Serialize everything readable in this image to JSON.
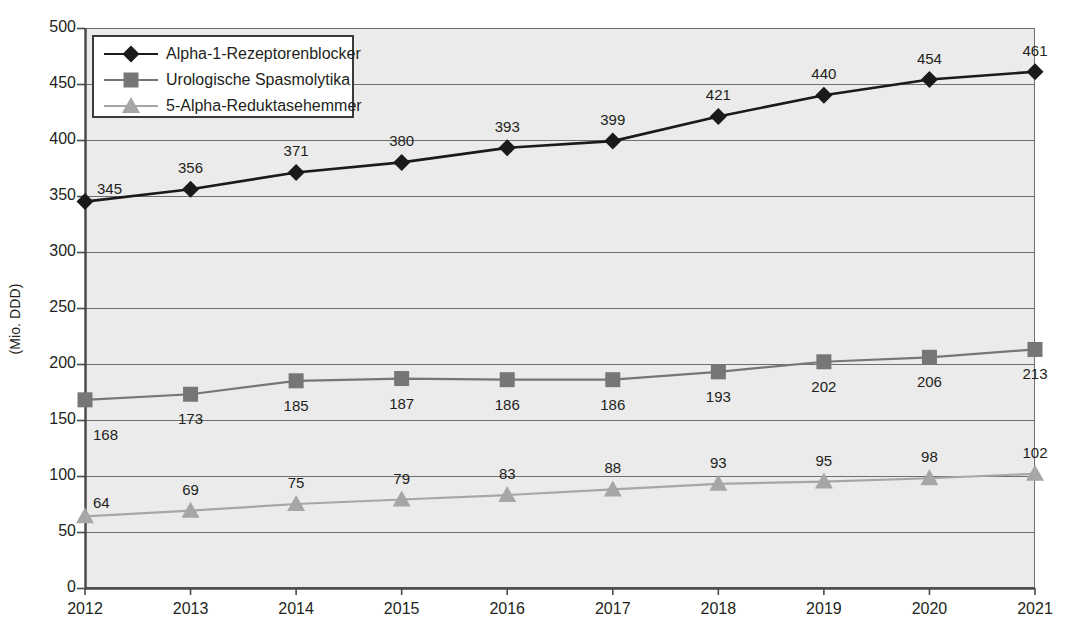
{
  "chart_data": {
    "type": "line",
    "title": "",
    "xlabel": "",
    "ylabel": "(Mio. DDD)",
    "categories": [
      "2012",
      "2013",
      "2014",
      "2015",
      "2016",
      "2017",
      "2018",
      "2019",
      "2020",
      "2021"
    ],
    "ylim": [
      0,
      500
    ],
    "yticks": [
      0,
      50,
      100,
      150,
      200,
      250,
      300,
      350,
      400,
      450,
      500
    ],
    "ytick_labels": [
      "0",
      "50",
      "100",
      "150",
      "200",
      "250",
      "300",
      "350",
      "400",
      "450",
      "500"
    ],
    "grid": true,
    "grid_axis": "y",
    "legend_position": "top-left",
    "series": [
      {
        "name": "Alpha-1-Rezeptorenblocker",
        "marker": "diamond",
        "color": "#1a1a1a",
        "values": [
          345,
          356,
          371,
          380,
          393,
          399,
          421,
          440,
          454,
          461
        ],
        "labels": [
          "345",
          "356",
          "371",
          "380",
          "393",
          "399",
          "421",
          "440",
          "454",
          "461"
        ]
      },
      {
        "name": "Urologische Spasmolytika",
        "marker": "square",
        "color": "#767676",
        "values": [
          168,
          173,
          185,
          187,
          186,
          186,
          193,
          202,
          206,
          213
        ],
        "labels": [
          "168",
          "173",
          "185",
          "187",
          "186",
          "186",
          "193",
          "202",
          "206",
          "213"
        ]
      },
      {
        "name": "5-Alpha-Reduktasehemmer",
        "marker": "triangle",
        "color": "#a6a6a6",
        "values": [
          64,
          69,
          75,
          79,
          83,
          88,
          93,
          95,
          98,
          102
        ],
        "labels": [
          "64",
          "69",
          "75",
          "79",
          "83",
          "88",
          "93",
          "95",
          "98",
          "102"
        ]
      }
    ]
  },
  "legend": {
    "items": [
      {
        "label": "Alpha-1-Rezeptorenblocker",
        "icon": "diamond-marker-icon"
      },
      {
        "label": "Urologische Spasmolytika",
        "icon": "square-marker-icon"
      },
      {
        "label": "5-Alpha-Reduktasehemmer",
        "icon": "triangle-marker-icon"
      }
    ]
  },
  "colors": {
    "plot_background": "#ebebeb",
    "gridline": "#6f6f6f",
    "axis": "#4a4a4a",
    "text": "#231f20",
    "series_1": "#1a1a1a",
    "series_2": "#767676",
    "series_3": "#a6a6a6"
  }
}
